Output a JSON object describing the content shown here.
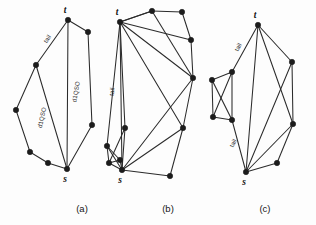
{
  "figure": {
    "background_color": "#fdfdfd",
    "edge_color": "#2b2b2b",
    "node_color": "#1c1c1c"
  },
  "captions": {
    "a": "(a)",
    "b": "(b)",
    "c": "(c)"
  },
  "labels": {
    "source": "s",
    "sink": "t",
    "tail": "tail",
    "d1qso": "d1QSO"
  },
  "panels": [
    {
      "id": "a",
      "caption": "(a)",
      "width": 92,
      "height": 195,
      "nodes": [
        {
          "name": "t",
          "x": 60,
          "y": 20,
          "label": "t",
          "label_dx": -3,
          "label_dy": -7
        },
        {
          "name": "v1",
          "x": 28,
          "y": 65,
          "label": "",
          "label_dx": 0,
          "label_dy": 0
        },
        {
          "name": "s",
          "x": 59,
          "y": 169,
          "label": "s",
          "label_dx": -2,
          "label_dy": 13
        },
        {
          "name": "r1",
          "x": 80,
          "y": 32,
          "label": "",
          "label_dx": 0,
          "label_dy": 0
        },
        {
          "name": "r2",
          "x": 84,
          "y": 125,
          "label": "",
          "label_dx": 0,
          "label_dy": 0
        },
        {
          "name": "l1",
          "x": 8,
          "y": 110,
          "label": "",
          "label_dx": 0,
          "label_dy": 0
        },
        {
          "name": "l2",
          "x": 22,
          "y": 152,
          "label": "",
          "label_dx": 0,
          "label_dy": 0
        },
        {
          "name": "l3",
          "x": 40,
          "y": 163,
          "label": "",
          "label_dx": 0,
          "label_dy": 0
        }
      ],
      "edges": [
        {
          "from": "t",
          "to": "v1"
        },
        {
          "from": "t",
          "to": "s"
        },
        {
          "from": "t",
          "to": "r1"
        },
        {
          "from": "r1",
          "to": "r2"
        },
        {
          "from": "r2",
          "to": "s"
        },
        {
          "from": "v1",
          "to": "l1"
        },
        {
          "from": "l1",
          "to": "l2"
        },
        {
          "from": "l2",
          "to": "l3"
        },
        {
          "from": "l3",
          "to": "s"
        },
        {
          "from": "v1",
          "to": "s"
        }
      ],
      "edge_labels": [
        {
          "text": "tail",
          "x": 41,
          "y": 40,
          "rotate": -56
        },
        {
          "text": "d1QSO",
          "x": 36,
          "y": 118,
          "rotate": -78
        },
        {
          "text": "d1QSO",
          "x": 70,
          "y": 92,
          "rotate": -80
        }
      ]
    },
    {
      "id": "b",
      "caption": "(b)",
      "width": 100,
      "height": 195,
      "nodes": [
        {
          "name": "t",
          "x": 16,
          "y": 22,
          "label": "t",
          "label_dx": -3,
          "label_dy": -7
        },
        {
          "name": "n1",
          "x": 48,
          "y": 11,
          "label": "",
          "label_dx": 0,
          "label_dy": 0
        },
        {
          "name": "n2",
          "x": 78,
          "y": 12,
          "label": "",
          "label_dx": 0,
          "label_dy": 0
        },
        {
          "name": "n3",
          "x": 87,
          "y": 40,
          "label": "",
          "label_dx": 0,
          "label_dy": 0
        },
        {
          "name": "n4",
          "x": 89,
          "y": 78,
          "label": "",
          "label_dx": 0,
          "label_dy": 0
        },
        {
          "name": "n5",
          "x": 79,
          "y": 128,
          "label": "",
          "label_dx": 0,
          "label_dy": 0
        },
        {
          "name": "n6",
          "x": 66,
          "y": 176,
          "label": "",
          "label_dx": 0,
          "label_dy": 0
        },
        {
          "name": "s",
          "x": 18,
          "y": 170,
          "label": "s",
          "label_dx": -2,
          "label_dy": 13
        },
        {
          "name": "n7",
          "x": 3,
          "y": 146,
          "label": "",
          "label_dx": 0,
          "label_dy": 0
        },
        {
          "name": "n8",
          "x": 16,
          "y": 160,
          "label": "",
          "label_dx": 0,
          "label_dy": 0
        },
        {
          "name": "n9",
          "x": 5,
          "y": 163,
          "label": "",
          "label_dx": 0,
          "label_dy": 0
        },
        {
          "name": "n10",
          "x": 21,
          "y": 128,
          "label": "",
          "label_dx": 0,
          "label_dy": 0
        }
      ],
      "edges": [
        {
          "from": "t",
          "to": "n1"
        },
        {
          "from": "n1",
          "to": "n2"
        },
        {
          "from": "n2",
          "to": "n3"
        },
        {
          "from": "n3",
          "to": "n4"
        },
        {
          "from": "t",
          "to": "n3"
        },
        {
          "from": "t",
          "to": "n4"
        },
        {
          "from": "t",
          "to": "n5"
        },
        {
          "from": "t",
          "to": "n1"
        },
        {
          "from": "n1",
          "to": "n4"
        },
        {
          "from": "t",
          "to": "s"
        },
        {
          "from": "t",
          "to": "n10"
        },
        {
          "from": "t",
          "to": "n7"
        },
        {
          "from": "n4",
          "to": "n5"
        },
        {
          "from": "n4",
          "to": "s"
        },
        {
          "from": "n5",
          "to": "n6"
        },
        {
          "from": "n5",
          "to": "s"
        },
        {
          "from": "n6",
          "to": "s"
        },
        {
          "from": "n10",
          "to": "s"
        },
        {
          "from": "n10",
          "to": "n9"
        },
        {
          "from": "n7",
          "to": "n8"
        },
        {
          "from": "n7",
          "to": "s"
        },
        {
          "from": "n9",
          "to": "s"
        },
        {
          "from": "n8",
          "to": "n9"
        },
        {
          "from": "n8",
          "to": "s"
        },
        {
          "from": "n7",
          "to": "n9"
        }
      ],
      "edge_labels": [
        {
          "text": "tail",
          "x": 10,
          "y": 92,
          "rotate": -82
        }
      ]
    },
    {
      "id": "c",
      "caption": "(c)",
      "width": 96,
      "height": 195,
      "nodes": [
        {
          "name": "t",
          "x": 50,
          "y": 25,
          "label": "t",
          "label_dx": -3,
          "label_dy": -7
        },
        {
          "name": "m1",
          "x": 84,
          "y": 62,
          "label": "",
          "label_dx": 0,
          "label_dy": 0
        },
        {
          "name": "m2",
          "x": 85,
          "y": 124,
          "label": "",
          "label_dx": 0,
          "label_dy": 0
        },
        {
          "name": "m3",
          "x": 69,
          "y": 163,
          "label": "",
          "label_dx": 0,
          "label_dy": 0
        },
        {
          "name": "s",
          "x": 38,
          "y": 172,
          "label": "s",
          "label_dx": -2,
          "label_dy": 13
        },
        {
          "name": "p1",
          "x": 24,
          "y": 72,
          "label": "",
          "label_dx": 0,
          "label_dy": 0
        },
        {
          "name": "p2",
          "x": 4,
          "y": 80,
          "label": "",
          "label_dx": 0,
          "label_dy": 0
        },
        {
          "name": "p3",
          "x": 5,
          "y": 117,
          "label": "",
          "label_dx": 0,
          "label_dy": 0
        },
        {
          "name": "p4",
          "x": 24,
          "y": 120,
          "label": "",
          "label_dx": 0,
          "label_dy": 0
        }
      ],
      "edges": [
        {
          "from": "t",
          "to": "m1"
        },
        {
          "from": "m1",
          "to": "m2"
        },
        {
          "from": "m2",
          "to": "m3"
        },
        {
          "from": "m3",
          "to": "s"
        },
        {
          "from": "m2",
          "to": "s"
        },
        {
          "from": "t",
          "to": "m2"
        },
        {
          "from": "t",
          "to": "s"
        },
        {
          "from": "t",
          "to": "p1"
        },
        {
          "from": "m1",
          "to": "s"
        },
        {
          "from": "p1",
          "to": "p2"
        },
        {
          "from": "p1",
          "to": "p4"
        },
        {
          "from": "p1",
          "to": "p3"
        },
        {
          "from": "p2",
          "to": "p3"
        },
        {
          "from": "p2",
          "to": "p4"
        },
        {
          "from": "p3",
          "to": "p4"
        },
        {
          "from": "p4",
          "to": "s"
        }
      ],
      "edge_labels": [
        {
          "text": "tail",
          "x": 32,
          "y": 48,
          "rotate": -62
        },
        {
          "text": "tail",
          "x": 27,
          "y": 144,
          "rotate": -62
        }
      ]
    }
  ]
}
